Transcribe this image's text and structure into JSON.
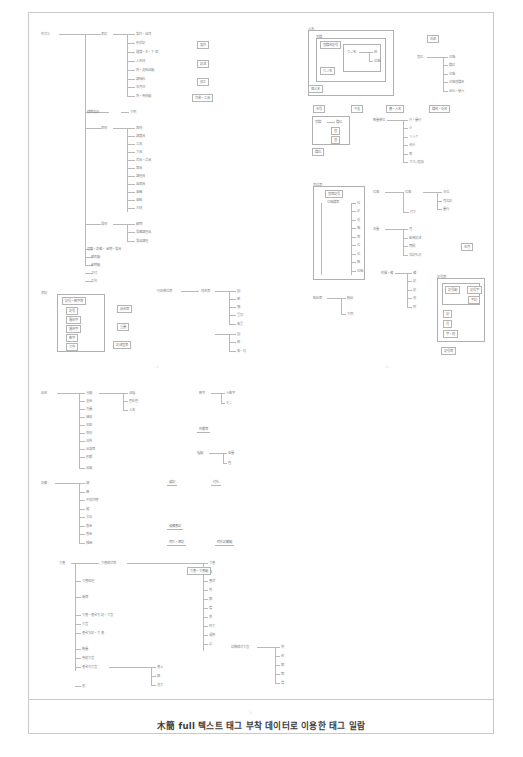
{
  "document": {
    "kind": "scanned-figure-page",
    "caption": "木簡 full 텍스트 태그 부착 데이터로 이용한 태그 일람",
    "page_markers": [
      "- 1 -",
      "- 2 -",
      "- 3 -"
    ],
    "border_color": "#c9c9c9",
    "ink_color": "#8a8a8a",
    "caption_color": "#3b3b3b"
  },
  "columns": {
    "left_top": {
      "root": "形式と",
      "branches": [
        {
          "label": "表記",
          "children": [
            "製作・自然",
            "形状記",
            "題箋・木・下端",
            "人名材",
            "内・支給品類",
            "調味料",
            "年月日",
            "内・用材類"
          ]
        },
        {
          "label": "織維製品",
          "children": [
            "文例"
          ]
        },
        {
          "label": "器材",
          "children": [
            "器材",
            "調度具",
            "工具",
            "文具",
            "武具・兵具",
            "器具",
            "調理具",
            "容器具",
            "車輪",
            "車輛",
            "木材"
          ]
        },
        {
          "label": "食材",
          "children": [
            "穀物",
            "食事調理品",
            "食品調理"
          ]
        },
        {
          "label": "建築・設備・金物・食具",
          "children": []
        },
        {
          "label": "薬剤類",
          "children": []
        },
        {
          "label": "動物類",
          "children": []
        },
        {
          "label": "文付",
          "children": []
        },
        {
          "label": "文句",
          "children": []
        },
        {
          "label": "雑",
          "children": []
        }
      ],
      "side_boxes": [
        "製作",
        "記述",
        "加工",
        "作業・工具"
      ]
    },
    "left_mid": {
      "framed_group": {
        "title": "表記",
        "header_box": "記号・数字等",
        "items": [
          "記号",
          "異体字",
          "異体字",
          "数字",
          "文字"
        ]
      },
      "right_items": [
        "品名等",
        "重量",
        "単位",
        "記述型等"
      ],
      "tree_a": {
        "root": "行政単位等",
        "children": [
          "国",
          "郡",
          "郷",
          "里坊",
          "条里"
        ]
      },
      "tree_b": {
        "root": "地名等",
        "children": [
          "国",
          "郡",
          "条里",
          "条・坊"
        ]
      }
    },
    "left_lower": {
      "tree_main": {
        "root": "品名",
        "children": [
          "分類",
          "支給",
          "方量",
          "価格",
          "年齢",
          "性別",
          "住所",
          "出身等",
          "形態",
          "品質"
        ]
      },
      "tree_main_sub": {
        "parent": "分類",
        "children": [
          "品種",
          "色彩色",
          "人名"
        ]
      },
      "right_tree_a": {
        "root": "数字",
        "children": [
          "人数字",
          "そこ"
        ]
      },
      "right_label": "形態等",
      "right_tree_b": {
        "root": "種類",
        "children": [
          "容量",
          "色"
        ]
      }
    },
    "left_lower2": {
      "tree": {
        "root": "記載",
        "children": [
          "調",
          "庸",
          "中男作物",
          "贄",
          "交易",
          "春米",
          "舂米",
          "雑徭"
        ]
      },
      "side_labels": [
        "贄記",
        "付札"
      ],
      "side_boxes": [
        "贄備書記",
        "荷札・運記",
        "荷札記載類"
      ]
    },
    "left_bottom": {
      "tree": {
        "root": "文書",
        "children": [
          "文書様式等",
          "文書処理",
          "帳簿",
          "文書・書き方記・文言",
          "文言",
          "書き方記・文書",
          "数量",
          "用途文言",
          "書き方文言",
          "他"
        ]
      },
      "tree_right_children": [
        "文書",
        "帳",
        "書状",
        "符",
        "解",
        "牒",
        "移",
        "召文",
        "過所",
        "請"
      ],
      "sub_tree": {
        "parent": "書き方文言",
        "children": [
          "書上",
          "解",
          "送文"
        ]
      },
      "side_box": "文書・文書類",
      "right_tree": {
        "root": "試験様式文言",
        "children": [
          "符",
          "召",
          "解",
          "案",
          "牒"
        ]
      }
    },
    "right_top": {
      "outer_frame_label": "人名",
      "inner_frame_label": "官職",
      "header_box": "官職名記号",
      "inner_inner": {
        "root": "ウジ名",
        "children": [
          "姓",
          "位階"
        ]
      },
      "small_box": "ウジ名",
      "footer_box": "個人名",
      "side_box": "氏姓",
      "side_tree": {
        "root": "官位",
        "children": [
          "位階",
          "職位",
          "位階",
          "位階官職名",
          "出仕・使入"
        ]
      }
    },
    "right_mid": {
      "inline_boxes": [
        "年号",
        "干支",
        "暦・人名",
        "職名・氏名"
      ],
      "framed_tree": {
        "root": "官職",
        "children": [
          "職位"
        ],
        "sub": [
          "官",
          "官"
        ]
      },
      "framed_footer": "職位",
      "tree_units": {
        "root": "数量単位",
        "children": [
          "斤・量行",
          "斗",
          "ミリグ",
          "合升",
          "束",
          "マス(追加)"
        ]
      },
      "tree_pair": {
        "root": "位階",
        "children": [
          "位階",
          "付丁"
        ],
        "right": [
          "本位",
          "有位記",
          "量行"
        ]
      },
      "tree_year": {
        "root": "年量",
        "children": [
          "月",
          "動用記述",
          "期間",
          "浮記もの"
        ]
      },
      "side_box": "年月"
    },
    "right_framed": {
      "title": "官位等",
      "header_box": "官等記号",
      "sub_label": "位階職等",
      "items": [
        "位",
        "正",
        "従",
        "階",
        "等",
        "位",
        "位",
        "無",
        "位階"
      ]
    },
    "right_lower": {
      "tree": {
        "root": "輸出等",
        "children": [
          "輸出",
          "文例"
        ]
      },
      "tree2": {
        "root": "附属・備",
        "children": [
          "備",
          "記",
          "記",
          "他",
          "附"
        ]
      },
      "frame": {
        "title": "記号等",
        "boxes_top": [
          "記号類",
          "記号字"
        ],
        "small_box": "字記",
        "stack": [
          "記",
          "号",
          "字・他"
        ],
        "footer_box": "記号等"
      }
    }
  }
}
